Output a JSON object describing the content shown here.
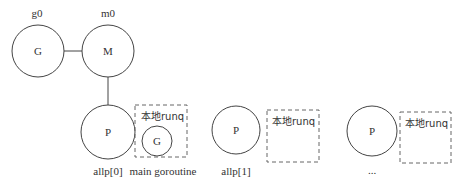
{
  "diagram": {
    "top_labels": {
      "g0": "g0",
      "m0": "m0"
    },
    "nodes": {
      "g0": {
        "label": "G"
      },
      "m0": {
        "label": "M"
      },
      "p0": {
        "label": "P",
        "caption": "allp[0]"
      },
      "p1": {
        "label": "P",
        "caption": "allp[1]"
      },
      "p2": {
        "label": "P",
        "caption": "..."
      },
      "main_g": {
        "label": "G",
        "caption": "main goroutine"
      }
    },
    "runqs": [
      {
        "label": "本地runq"
      },
      {
        "label": "本地runq"
      },
      {
        "label": "本地runq"
      }
    ],
    "colors": {
      "stroke": "#444444",
      "dash": "#666666",
      "text": "#333333"
    }
  }
}
